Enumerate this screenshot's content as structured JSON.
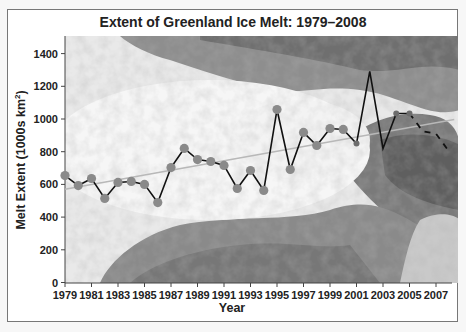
{
  "chart_data": {
    "type": "line",
    "title": "Extent of Greenland Ice Melt: 1979–2008",
    "xlabel": "Year",
    "ylabel": "Melt Extent (1000s km²)",
    "ylabel_main": "Melt Extent (1000s km",
    "ylabel_sup": "2",
    "ylabel_close": ")",
    "ylim": [
      0,
      1500
    ],
    "xlim": [
      1979,
      2008
    ],
    "yticks": [
      0,
      200,
      400,
      600,
      800,
      1000,
      1200,
      1400
    ],
    "xticks": [
      1979,
      1981,
      1983,
      1985,
      1987,
      1989,
      1991,
      1993,
      1995,
      1997,
      1999,
      2001,
      2003,
      2005,
      2007
    ],
    "grid": false,
    "legend": null,
    "background": "satellite image of Greenland (grayscale)",
    "series": [
      {
        "name": "Melt extent",
        "style": "solid black line with gray circle markers (1979-2001), solid line 2001-2005, dashed 2005-2008",
        "x": [
          1979,
          1980,
          1981,
          1982,
          1983,
          1984,
          1985,
          1986,
          1987,
          1988,
          1989,
          1990,
          1991,
          1992,
          1993,
          1994,
          1995,
          1996,
          1997,
          1998,
          1999,
          2000,
          2001,
          2002,
          2003,
          2004,
          2005,
          2006,
          2007,
          2008
        ],
        "values": [
          654,
          593,
          636,
          514,
          612,
          618,
          600,
          489,
          703,
          820,
          752,
          740,
          716,
          575,
          685,
          563,
          1058,
          691,
          918,
          838,
          942,
          936,
          850,
          1291,
          820,
          1034,
          1034,
          925,
          910,
          800
        ]
      },
      {
        "name": "Linear trend",
        "style": "light gray straight line",
        "x": [
          1979,
          2008
        ],
        "values": [
          570,
          997
        ]
      }
    ],
    "colors": {
      "line": "#111111",
      "marker": "#8a8a8a",
      "trend": "#b8b8b8"
    }
  }
}
